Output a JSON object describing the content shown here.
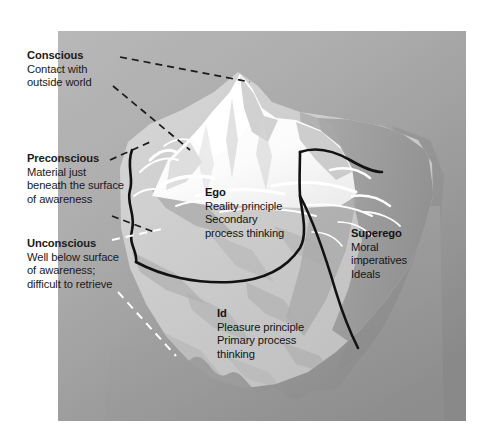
{
  "figure": {
    "type": "diagram",
    "background_color": "#a8a8a8",
    "panel": {
      "x": 58,
      "y": 31,
      "width": 408,
      "height": 390,
      "gradient_top_left": "#b6b6b6",
      "gradient_bottom_right": "#8b8b8b"
    },
    "iceberg": {
      "tip_color": "#ffffff",
      "submerged_color": "#c8c8c8",
      "shadow_color": "#9a9a9a",
      "outline_color": "#111111"
    }
  },
  "labels": {
    "conscious": {
      "heading": "Conscious",
      "lines": [
        "Contact with",
        "outside world"
      ],
      "leader_style": "black-dashed",
      "leader_color": "#1b1b1b"
    },
    "preconscious": {
      "heading": "Preconscious",
      "lines": [
        "Material just",
        "beneath the surface",
        "of awareness"
      ],
      "leader_style": "black-dashed",
      "leader_color": "#1b1b1b"
    },
    "unconscious": {
      "heading": "Unconscious",
      "lines": [
        "Well below surface",
        "of awareness;",
        "difficult to retrieve"
      ],
      "leader_style": "white-dashed",
      "leader_color": "#ffffff"
    },
    "ego": {
      "heading": "Ego",
      "lines": [
        "Reality principle",
        "Secondary",
        "process thinking"
      ]
    },
    "superego": {
      "heading": "Superego",
      "lines": [
        "Moral",
        "imperatives",
        "Ideals"
      ]
    },
    "id": {
      "heading": "Id",
      "lines": [
        "Pleasure principle",
        "Primary process",
        "thinking"
      ]
    }
  }
}
